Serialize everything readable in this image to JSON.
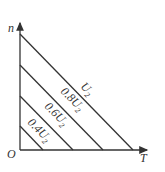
{
  "diagram": {
    "y_axis_label": "n",
    "x_axis_label": "T",
    "origin_label": "O",
    "lines": [
      {
        "label": "U",
        "sub": "2",
        "prefix": ""
      },
      {
        "label": "U",
        "sub": "2",
        "prefix": "0.8"
      },
      {
        "label": "U",
        "sub": "2",
        "prefix": "0.6"
      },
      {
        "label": "U",
        "sub": "2",
        "prefix": "0.4"
      }
    ],
    "line_color": "#333333"
  }
}
